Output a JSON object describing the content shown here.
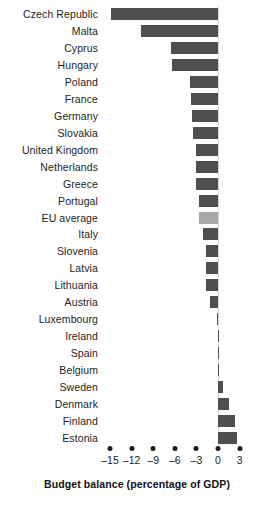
{
  "chart_data": {
    "type": "bar",
    "orientation": "horizontal",
    "title": "",
    "xlabel": "Budget balance (percentage of GDP)",
    "ylabel": "",
    "xlim": [
      -16,
      4
    ],
    "xticks": [
      -15,
      -12,
      -9,
      -6,
      -3,
      0,
      3
    ],
    "xtick_labels": [
      "–15",
      "–12",
      "–9",
      "–6",
      "–3",
      "0",
      "3"
    ],
    "grid": false,
    "legend": "none",
    "bar_color": "#4f4f4f",
    "highlight_color": "#a8a8a8",
    "highlight_category": "EU  average",
    "categories": [
      "Czech Republic",
      "Malta",
      "Cyprus",
      "Hungary",
      "Poland",
      "France",
      "Germany",
      "Slovakia",
      "United Kingdom",
      "Netherlands",
      "Greece",
      "Portugal",
      "EU  average",
      "Italy",
      "Slovenia",
      "Latvia",
      "Lithuania",
      "Austria",
      "Luxembourg",
      "Ireland",
      "Spain",
      "Belgium",
      "Sweden",
      "Denmark",
      "Finland",
      "Estonia"
    ],
    "values": [
      -14.8,
      -10.7,
      -6.5,
      -6.4,
      -3.9,
      -3.8,
      -3.6,
      -3.5,
      -3.1,
      -3.1,
      -3.0,
      -2.7,
      -2.6,
      -2.1,
      -1.7,
      -1.6,
      -1.6,
      -1.1,
      -0.1,
      0.1,
      0.1,
      0.1,
      0.7,
      1.5,
      2.3,
      2.6
    ],
    "series": [
      {
        "name": "Budget balance (percentage of GDP)",
        "values": [
          -14.8,
          -10.7,
          -6.5,
          -6.4,
          -3.9,
          -3.8,
          -3.6,
          -3.5,
          -3.1,
          -3.1,
          -3.0,
          -2.7,
          -2.6,
          -2.1,
          -1.7,
          -1.6,
          -1.6,
          -1.1,
          -0.1,
          0.1,
          0.1,
          0.1,
          0.7,
          1.5,
          2.3,
          2.6
        ]
      }
    ]
  }
}
